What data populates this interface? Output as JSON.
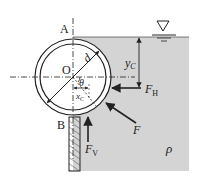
{
  "diagram": {
    "labels": {
      "point_a": "A",
      "point_b": "B",
      "center_o": "O",
      "diameter": "d",
      "angle": "θ",
      "depth": "y",
      "depth_sub": "C",
      "xc": "x",
      "xc_sub": "C",
      "force_h": "F",
      "force_h_sub": "H",
      "force_v": "F",
      "force_v_sub": "V",
      "force_total": "F",
      "density": "ρ"
    },
    "colors": {
      "water": "#d4d4d4",
      "line": "#222222",
      "background": "#ffffff"
    }
  }
}
